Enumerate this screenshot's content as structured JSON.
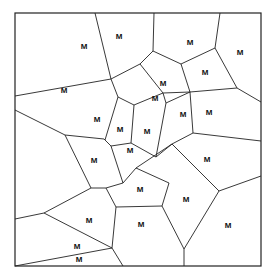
{
  "diagram": {
    "type": "voronoi",
    "frame": {
      "x1": 15,
      "y1": 13,
      "x2": 261,
      "y2": 266
    },
    "line_color": "#222222",
    "background": "#ffffff",
    "edges": [
      [
        [
          95,
          13
        ],
        [
          111,
          79
        ]
      ],
      [
        [
          15,
          96
        ],
        [
          111,
          79
        ]
      ],
      [
        [
          111,
          79
        ],
        [
          118,
          97
        ]
      ],
      [
        [
          111,
          79
        ],
        [
          140,
          64
        ]
      ],
      [
        [
          140,
          64
        ],
        [
          153,
          51
        ]
      ],
      [
        [
          153,
          51
        ],
        [
          154,
          13
        ]
      ],
      [
        [
          153,
          51
        ],
        [
          181,
          64
        ]
      ],
      [
        [
          181,
          64
        ],
        [
          215,
          48
        ]
      ],
      [
        [
          215,
          48
        ],
        [
          220,
          13
        ]
      ],
      [
        [
          215,
          48
        ],
        [
          237,
          88
        ]
      ],
      [
        [
          237,
          88
        ],
        [
          261,
          102
        ]
      ],
      [
        [
          181,
          64
        ],
        [
          190,
          92
        ]
      ],
      [
        [
          190,
          92
        ],
        [
          237,
          88
        ]
      ],
      [
        [
          140,
          64
        ],
        [
          163,
          93
        ]
      ],
      [
        [
          163,
          93
        ],
        [
          190,
          92
        ]
      ],
      [
        [
          118,
          97
        ],
        [
          105,
          140
        ]
      ],
      [
        [
          15,
          110
        ],
        [
          65,
          135
        ]
      ],
      [
        [
          65,
          135
        ],
        [
          104,
          139
        ]
      ],
      [
        [
          104,
          139
        ],
        [
          111,
          146
        ]
      ],
      [
        [
          118,
          97
        ],
        [
          134,
          105
        ]
      ],
      [
        [
          134,
          105
        ],
        [
          131,
          143
        ]
      ],
      [
        [
          134,
          105
        ],
        [
          163,
          93
        ]
      ],
      [
        [
          131,
          143
        ],
        [
          111,
          146
        ]
      ],
      [
        [
          131,
          143
        ],
        [
          156,
          157
        ]
      ],
      [
        [
          156,
          157
        ],
        [
          166,
          103
        ]
      ],
      [
        [
          163,
          93
        ],
        [
          166,
          103
        ]
      ],
      [
        [
          156,
          157
        ],
        [
          172,
          144
        ]
      ],
      [
        [
          166,
          103
        ],
        [
          190,
          92
        ]
      ],
      [
        [
          172,
          144
        ],
        [
          193,
          133
        ]
      ],
      [
        [
          193,
          133
        ],
        [
          261,
          141
        ]
      ],
      [
        [
          190,
          92
        ],
        [
          193,
          133
        ]
      ],
      [
        [
          111,
          146
        ],
        [
          123,
          183
        ]
      ],
      [
        [
          65,
          135
        ],
        [
          91,
          188
        ]
      ],
      [
        [
          91,
          188
        ],
        [
          106,
          188
        ]
      ],
      [
        [
          106,
          188
        ],
        [
          123,
          183
        ]
      ],
      [
        [
          123,
          183
        ],
        [
          136,
          168
        ]
      ],
      [
        [
          136,
          168
        ],
        [
          172,
          144
        ]
      ],
      [
        [
          172,
          144
        ],
        [
          219,
          191
        ]
      ],
      [
        [
          219,
          191
        ],
        [
          261,
          176
        ]
      ],
      [
        [
          106,
          188
        ],
        [
          116,
          207
        ]
      ],
      [
        [
          15,
          219
        ],
        [
          44,
          213
        ]
      ],
      [
        [
          44,
          213
        ],
        [
          91,
          188
        ]
      ],
      [
        [
          44,
          213
        ],
        [
          112,
          248
        ]
      ],
      [
        [
          116,
          207
        ],
        [
          112,
          248
        ]
      ],
      [
        [
          116,
          207
        ],
        [
          162,
          206
        ]
      ],
      [
        [
          162,
          206
        ],
        [
          169,
          183
        ]
      ],
      [
        [
          169,
          183
        ],
        [
          136,
          168
        ]
      ],
      [
        [
          162,
          206
        ],
        [
          184,
          249
        ]
      ],
      [
        [
          184,
          249
        ],
        [
          219,
          191
        ]
      ],
      [
        [
          184,
          249
        ],
        [
          184,
          266
        ]
      ],
      [
        [
          112,
          248
        ],
        [
          123,
          266
        ]
      ],
      [
        [
          15,
          266
        ],
        [
          112,
          248
        ]
      ]
    ],
    "labels": [
      {
        "text": "M",
        "x": 84,
        "y": 47
      },
      {
        "text": "M",
        "x": 119,
        "y": 37
      },
      {
        "text": "M",
        "x": 190,
        "y": 43
      },
      {
        "text": "M",
        "x": 240,
        "y": 53
      },
      {
        "text": "M",
        "x": 205,
        "y": 73
      },
      {
        "text": "M",
        "x": 163,
        "y": 84
      },
      {
        "text": "M",
        "x": 155,
        "y": 99
      },
      {
        "text": "M",
        "x": 97,
        "y": 120
      },
      {
        "text": "M",
        "x": 120,
        "y": 130
      },
      {
        "text": "M",
        "x": 147,
        "y": 132
      },
      {
        "text": "M",
        "x": 183,
        "y": 115
      },
      {
        "text": "M",
        "x": 209,
        "y": 113
      },
      {
        "text": "M",
        "x": 64,
        "y": 91
      },
      {
        "text": "M",
        "x": 94,
        "y": 161
      },
      {
        "text": "M",
        "x": 130,
        "y": 151
      },
      {
        "text": "M",
        "x": 207,
        "y": 160
      },
      {
        "text": "M",
        "x": 140,
        "y": 190
      },
      {
        "text": "M",
        "x": 89,
        "y": 221
      },
      {
        "text": "M",
        "x": 141,
        "y": 225
      },
      {
        "text": "M",
        "x": 186,
        "y": 200
      },
      {
        "text": "M",
        "x": 228,
        "y": 226
      },
      {
        "text": "M",
        "x": 77,
        "y": 247
      },
      {
        "text": "M",
        "x": 79,
        "y": 260
      }
    ]
  }
}
